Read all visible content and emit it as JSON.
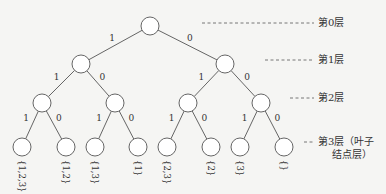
{
  "diagram": {
    "type": "binary-decision-tree",
    "colors": {
      "stroke": "#555555",
      "node_fill": "#ffffff",
      "text": "#333333",
      "background": "#f5f5f3"
    },
    "levels": [
      {
        "id": "level-0",
        "label": "第0层",
        "y": 26,
        "dash_x1": 202,
        "dash_x2": 314
      },
      {
        "id": "level-1",
        "label": "第1层",
        "y": 63,
        "dash_x1": 265,
        "dash_x2": 314
      },
      {
        "id": "level-2",
        "label": "第2层",
        "y": 101,
        "dash_x1": 290,
        "dash_x2": 314
      },
      {
        "id": "level-3",
        "label": "第3层（叶子",
        "label_line2": "结点层）",
        "y": 145,
        "dash_x1": 304,
        "dash_x2": 314
      }
    ],
    "nodes": [
      {
        "id": "n0",
        "x": 150,
        "y": 26
      },
      {
        "id": "n1",
        "x": 81,
        "y": 64
      },
      {
        "id": "n2",
        "x": 225,
        "y": 64
      },
      {
        "id": "n3",
        "x": 42,
        "y": 103
      },
      {
        "id": "n4",
        "x": 115,
        "y": 103
      },
      {
        "id": "n5",
        "x": 188,
        "y": 103
      },
      {
        "id": "n6",
        "x": 261,
        "y": 103
      },
      {
        "id": "n7",
        "x": 22,
        "y": 147,
        "leaf": "{1,2,3}"
      },
      {
        "id": "n8",
        "x": 66,
        "y": 147,
        "leaf": "{1,2}"
      },
      {
        "id": "n9",
        "x": 95,
        "y": 147,
        "leaf": "{1,3}"
      },
      {
        "id": "n10",
        "x": 138,
        "y": 147,
        "leaf": "{1}"
      },
      {
        "id": "n11",
        "x": 167,
        "y": 147,
        "leaf": "{2,3}"
      },
      {
        "id": "n12",
        "x": 211,
        "y": 147,
        "leaf": "{2}"
      },
      {
        "id": "n13",
        "x": 240,
        "y": 147,
        "leaf": "{3}"
      },
      {
        "id": "n14",
        "x": 284,
        "y": 147,
        "leaf": "{}"
      }
    ],
    "edges": [
      {
        "from": "n0",
        "to": "n1",
        "label": "1"
      },
      {
        "from": "n0",
        "to": "n2",
        "label": "0"
      },
      {
        "from": "n1",
        "to": "n3",
        "label": "1"
      },
      {
        "from": "n1",
        "to": "n4",
        "label": "0"
      },
      {
        "from": "n2",
        "to": "n5",
        "label": "1"
      },
      {
        "from": "n2",
        "to": "n6",
        "label": "0"
      },
      {
        "from": "n3",
        "to": "n7",
        "label": "1"
      },
      {
        "from": "n3",
        "to": "n8",
        "label": "0"
      },
      {
        "from": "n4",
        "to": "n9",
        "label": "1"
      },
      {
        "from": "n4",
        "to": "n10",
        "label": "0"
      },
      {
        "from": "n5",
        "to": "n11",
        "label": "1"
      },
      {
        "from": "n5",
        "to": "n12",
        "label": "0"
      },
      {
        "from": "n6",
        "to": "n13",
        "label": "1"
      },
      {
        "from": "n6",
        "to": "n14",
        "label": "0"
      }
    ],
    "node_radius": 9
  }
}
